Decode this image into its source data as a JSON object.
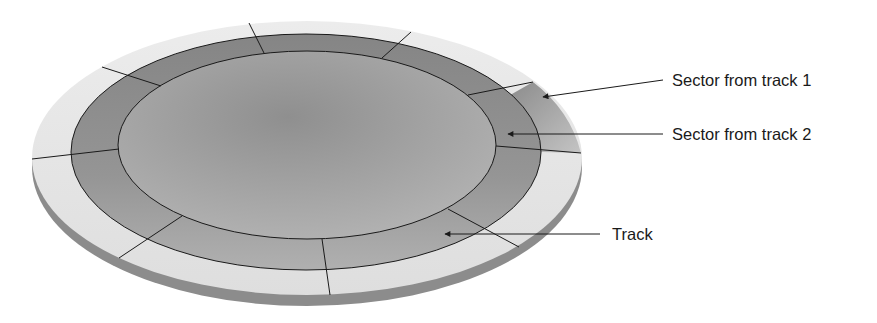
{
  "diagram": {
    "type": "disk-platter-illustration",
    "labels": {
      "sector_track1": "Sector from track 1",
      "sector_track2": "Sector from track 2",
      "track": "Track"
    },
    "colors": {
      "background": "#ffffff",
      "platter_edge_light": "#e6e6e6",
      "platter_side": "#8c8c8c",
      "track_ring": "#8e8e8e",
      "inner_surface": "#a4a4a4",
      "highlight_sector": "#9a9a9a",
      "lines": "#1a1a1a"
    }
  }
}
